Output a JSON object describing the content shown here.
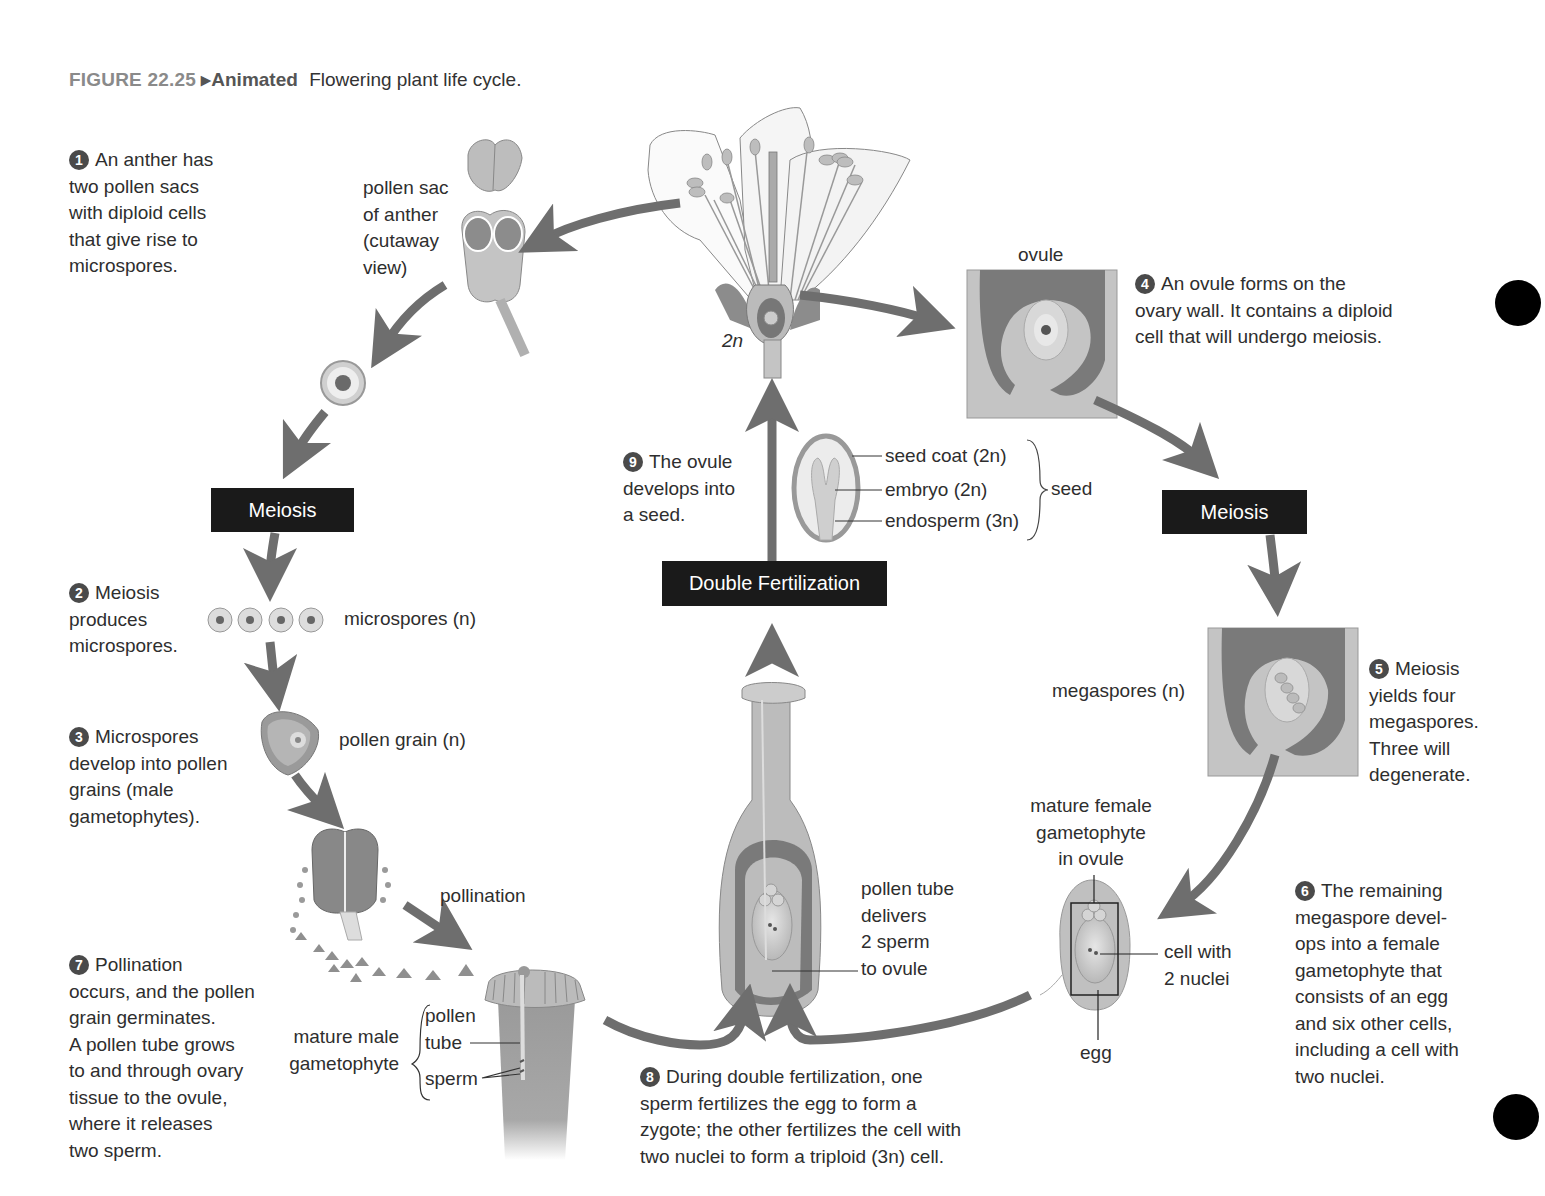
{
  "caption": {
    "figure": "FIGURE 22.25",
    "animated": "▸Animated",
    "title": "Flowering plant life cycle."
  },
  "steps": [
    {
      "num": "1",
      "lines": [
        "An anther has",
        "two pollen sacs",
        "with diploid cells",
        "that give rise to",
        "microspores."
      ]
    },
    {
      "num": "2",
      "lines": [
        "Meiosis",
        "produces",
        "microspores."
      ]
    },
    {
      "num": "3",
      "lines": [
        "Microspores",
        "develop into pollen",
        "grains (male",
        "gametophytes)."
      ]
    },
    {
      "num": "4",
      "lines": [
        "An ovule forms on the",
        "ovary wall. It contains a diploid",
        "cell that will undergo meiosis."
      ]
    },
    {
      "num": "5",
      "lines": [
        "Meiosis",
        "yields four",
        "megaspores.",
        "Three will",
        "degenerate."
      ]
    },
    {
      "num": "6",
      "lines": [
        "The remaining",
        "megaspore devel-",
        "ops into a female",
        "gametophyte that",
        "consists of an egg",
        "and six other cells,",
        "including a cell with",
        "two nuclei."
      ]
    },
    {
      "num": "7",
      "lines": [
        "Pollination",
        "occurs, and the pollen",
        "grain germinates.",
        "A pollen tube grows",
        "to and through ovary",
        "tissue to the ovule,",
        "where it releases",
        "two sperm."
      ]
    },
    {
      "num": "8",
      "lines": [
        "During double fertilization, one",
        "sperm fertilizes the egg to form a",
        "zygote; the other fertilizes the cell with",
        "two nuclei to form a triploid (3n) cell."
      ]
    },
    {
      "num": "9",
      "lines": [
        "The ovule",
        "develops into",
        "a seed."
      ]
    }
  ],
  "boxes": {
    "meiosis_left": "Meiosis",
    "meiosis_right": "Meiosis",
    "double_fertilization": "Double Fertilization"
  },
  "labels": {
    "pollen_sac": [
      "pollen sac",
      "of anther",
      "(cutaway",
      "view)"
    ],
    "flower_ploidy": "2n",
    "ovule": "ovule",
    "seed_coat": "seed coat (2n)",
    "embryo": "embryo (2n)",
    "endosperm": "endosperm (3n)",
    "seed": "seed",
    "microspores": "microspores (n)",
    "pollen_grain": "pollen grain (n)",
    "pollination": "pollination",
    "mature_male_gametophyte": [
      "mature male",
      "gametophyte"
    ],
    "pollen_tube": [
      "pollen",
      "tube"
    ],
    "sperm": "sperm",
    "pollen_tube_delivers": [
      "pollen tube",
      "delivers",
      "2 sperm",
      "to ovule"
    ],
    "megaspores": "megaspores (n)",
    "mature_female_gametophyte": [
      "mature female",
      "gametophyte",
      "in ovule"
    ],
    "cell_with_2_nuclei": [
      "cell with",
      "2 nuclei"
    ],
    "egg": "egg"
  },
  "colors": {
    "arrow": "#6e6e6e",
    "box": "#1a1a1a",
    "tissue_dark": "#7a7a7a",
    "tissue_light": "#c4c4c4",
    "background": "#ffffff"
  }
}
